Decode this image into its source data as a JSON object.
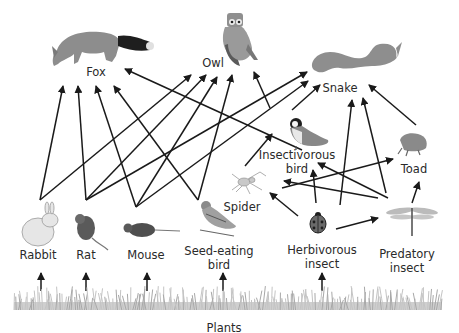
{
  "organisms": {
    "fox": {
      "label": "Fox"
    },
    "owl": {
      "label": "Owl"
    },
    "snake": {
      "label": "Snake"
    },
    "insectivorous_bird": {
      "label": "Insectivorous\nbird",
      "line1": "Insectivorous",
      "line2": "bird"
    },
    "toad": {
      "label": "Toad"
    },
    "spider": {
      "label": "Spider"
    },
    "rabbit": {
      "label": "Rabbit"
    },
    "rat": {
      "label": "Rat"
    },
    "mouse": {
      "label": "Mouse"
    },
    "seed_eating_bird": {
      "label": "Seed-eating bird",
      "line1": "Seed-eating",
      "line2": "bird"
    },
    "herbivorous_insect": {
      "label": "Herbivorous insect",
      "line1": "Herbivorous",
      "line2": "insect"
    },
    "predatory_insect": {
      "label": "Predatory insect",
      "line1": "Predatory",
      "line2": "insect"
    },
    "plants": {
      "label": "Plants"
    }
  },
  "links": [
    {
      "from": "rabbit",
      "to": "fox"
    },
    {
      "from": "rat",
      "to": "fox"
    },
    {
      "from": "mouse",
      "to": "fox"
    },
    {
      "from": "seed_eating_bird",
      "to": "fox"
    },
    {
      "from": "insectivorous_bird",
      "to": "fox"
    },
    {
      "from": "rabbit",
      "to": "owl"
    },
    {
      "from": "rat",
      "to": "owl"
    },
    {
      "from": "mouse",
      "to": "owl"
    },
    {
      "from": "seed_eating_bird",
      "to": "owl"
    },
    {
      "from": "insectivorous_bird",
      "to": "owl"
    },
    {
      "from": "rat",
      "to": "snake"
    },
    {
      "from": "mouse",
      "to": "snake"
    },
    {
      "from": "insectivorous_bird",
      "to": "snake"
    },
    {
      "from": "herbivorous_insect",
      "to": "snake"
    },
    {
      "from": "predatory_insect",
      "to": "snake"
    },
    {
      "from": "toad",
      "to": "snake"
    },
    {
      "from": "spider",
      "to": "insectivorous_bird"
    },
    {
      "from": "herbivorous_insect",
      "to": "insectivorous_bird"
    },
    {
      "from": "predatory_insect",
      "to": "insectivorous_bird"
    },
    {
      "from": "spider",
      "to": "toad"
    },
    {
      "from": "predatory_insect",
      "to": "toad"
    },
    {
      "from": "herbivorous_insect",
      "to": "spider"
    },
    {
      "from": "predatory_insect",
      "to": "spider"
    },
    {
      "from": "herbivorous_insect",
      "to": "predatory_insect"
    },
    {
      "from": "plants",
      "to": "rabbit"
    },
    {
      "from": "plants",
      "to": "rat"
    },
    {
      "from": "plants",
      "to": "mouse"
    },
    {
      "from": "plants",
      "to": "seed_eating_bird"
    },
    {
      "from": "plants",
      "to": "herbivorous_insect"
    }
  ],
  "colors": {
    "arrow": "#1a1a1a",
    "text": "#2a2a2a",
    "animal_gray": "#8a8a8a",
    "grass": "#b5b5b5",
    "background": "#ffffff"
  }
}
